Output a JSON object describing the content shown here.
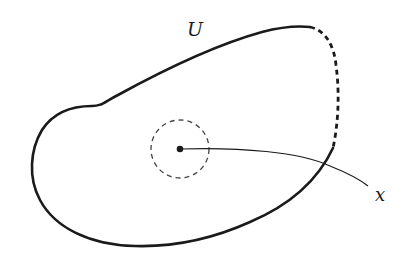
{
  "figure": {
    "labels": {
      "region": "U",
      "point_path": "x"
    },
    "colors": {
      "stroke": "#1a1a1a",
      "background": "#ffffff",
      "dashed_circle": "#444444"
    },
    "elements": {
      "region_boundary": "closed curve, partly solid, partly dashed (upper right)",
      "neighborhood": "dashed circle around interior point",
      "interior_point": "filled dot",
      "path": "curve from interior point exiting region toward label x"
    }
  }
}
